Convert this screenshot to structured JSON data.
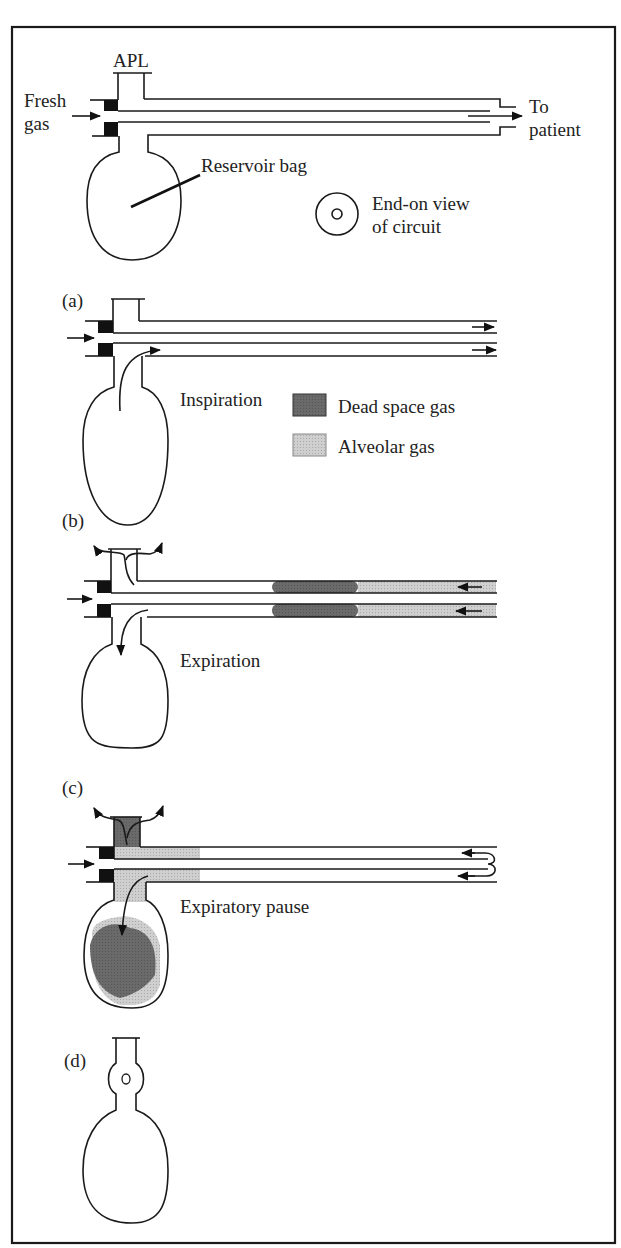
{
  "figure": {
    "frame": {
      "x": 12,
      "y": 27,
      "width": 603,
      "height": 1216
    },
    "colors": {
      "line": "#1a1a1a",
      "dead_space_gas": "#6a6a6a",
      "alveolar_gas": "#c9c9c9",
      "background": "#ffffff"
    },
    "overview": {
      "apl_label": "APL",
      "fresh_gas_label_line1": "Fresh",
      "fresh_gas_label_line2": "gas",
      "to_patient_line1": "To",
      "to_patient_line2": "patient",
      "reservoir_bag_label": "Reservoir bag",
      "end_on_view_line1": "End-on view",
      "end_on_view_line2": "of circuit"
    },
    "legend": {
      "items": [
        {
          "label": "Dead space gas",
          "color": "#6a6a6a"
        },
        {
          "label": "Alveolar gas",
          "color": "#c9c9c9"
        }
      ]
    },
    "panels": [
      {
        "id": "a",
        "tag": "(a)",
        "phase": "Inspiration"
      },
      {
        "id": "b",
        "tag": "(b)",
        "phase": "Expiration"
      },
      {
        "id": "c",
        "tag": "(c)",
        "phase": "Expiratory pause"
      },
      {
        "id": "d",
        "tag": "(d)",
        "phase": ""
      }
    ]
  }
}
